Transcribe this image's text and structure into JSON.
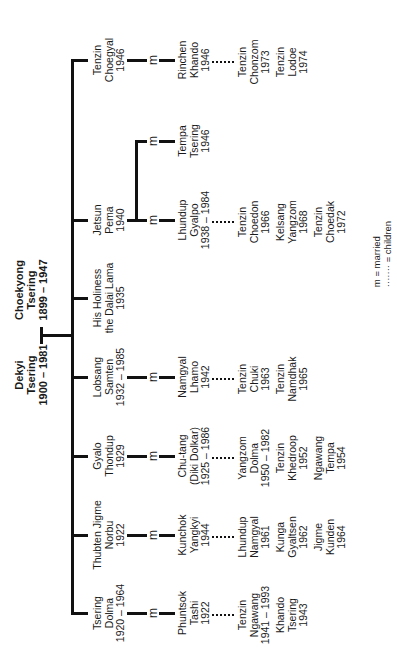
{
  "diagram": {
    "type": "family-tree",
    "orientation": "rotated-90-ccw",
    "parents": {
      "father": {
        "name_1": "Choekyong",
        "name_2": "Tsering",
        "dates": "1899 – 1947"
      },
      "mother": {
        "name_1": "Dekyi",
        "name_2": "Tsering",
        "dates": "1900 – 1981"
      }
    },
    "children": [
      {
        "lines": [
          "Tenzin",
          "Choegyal",
          "1946"
        ],
        "spouse": {
          "lines": [
            "Rinchen",
            "Khando",
            "1946"
          ]
        },
        "offspring": [
          {
            "lines": [
              "Tenzin",
              "Chonzom",
              "1973"
            ]
          },
          {
            "lines": [
              "Tenzin",
              "Lodoe",
              "1974"
            ]
          }
        ]
      },
      {
        "lines": [
          "Jetsun",
          "Pema",
          "1940"
        ],
        "spouses": [
          {
            "lines": [
              "Tempa",
              "Tsering",
              "1946"
            ]
          },
          {
            "lines": [
              "Lhundup",
              "Gyalpo",
              "1938 – 1984"
            ]
          }
        ],
        "offspring": [
          {
            "lines": [
              "Tenzin",
              "Choedon",
              "1966"
            ]
          },
          {
            "lines": [
              "Kelsang",
              "Yangzom",
              "1968"
            ]
          },
          {
            "lines": [
              "Tenzin",
              "Choedak",
              "1972"
            ]
          }
        ]
      },
      {
        "lines": [
          "His Holiness",
          "the Dalai Lama",
          "1935"
        ]
      },
      {
        "lines": [
          "Lobsang",
          "Samten",
          "1932 – 1985"
        ],
        "spouse": {
          "lines": [
            "Namgyal",
            "Lhamo",
            "1942"
          ]
        },
        "offspring": [
          {
            "lines": [
              "Tenzin",
              "Chuki",
              "1963"
            ]
          },
          {
            "lines": [
              "Tenzin",
              "Namdhak",
              "1965"
            ]
          }
        ]
      },
      {
        "lines": [
          "Gyalo",
          "Thondup",
          "1929"
        ],
        "spouse": {
          "lines": [
            "Chu-tang",
            "(Diki Dolkar)",
            "1925 – 1986"
          ]
        },
        "offspring": [
          {
            "lines": [
              "Yangzom",
              "Dolma",
              "1950 – 1982"
            ]
          },
          {
            "lines": [
              "Tenzin",
              "Khedroop",
              "1952"
            ]
          },
          {
            "lines": [
              "Ngawang",
              "Tempa",
              "1954"
            ]
          }
        ]
      },
      {
        "lines": [
          "Thubten Jigme",
          "Norbu",
          "1922"
        ],
        "spouse": {
          "lines": [
            "Kunchok",
            "Yangkyi",
            "1944"
          ]
        },
        "offspring": [
          {
            "lines": [
              "Lhundup",
              "Namgyal",
              "1961"
            ]
          },
          {
            "lines": [
              "Kunga",
              "Gyaltsen",
              "1962"
            ]
          },
          {
            "lines": [
              "Jigme",
              "Kunden",
              "1964"
            ]
          }
        ]
      },
      {
        "lines": [
          "Tsering",
          "Dolma",
          "1920 – 1964"
        ],
        "spouse": {
          "lines": [
            "Phuntsok",
            "Tashi",
            "1922"
          ]
        },
        "offspring": [
          {
            "lines": [
              "Tenzin",
              "Ngawang",
              "1941 – 1993"
            ]
          },
          {
            "lines": [
              "Khando",
              "Tsering",
              "1943"
            ]
          }
        ]
      }
    ],
    "married_symbol": "m",
    "legend": {
      "married": "m = married",
      "children": "······· = children"
    }
  }
}
